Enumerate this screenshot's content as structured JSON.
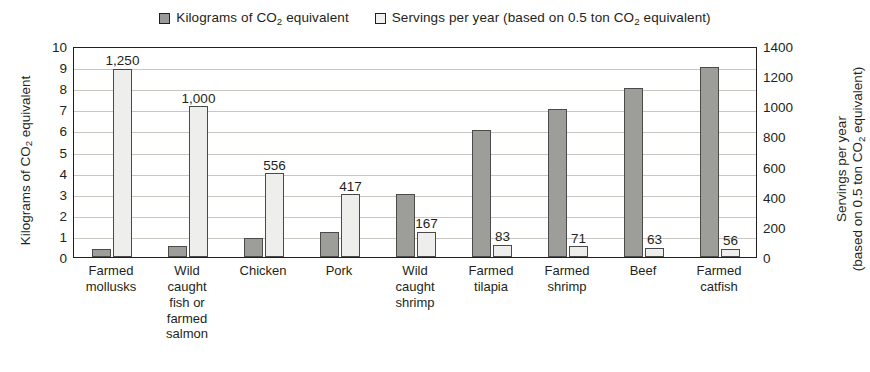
{
  "chart_data": {
    "type": "bar",
    "title": "",
    "categories": [
      "Farmed mollusks",
      "Wild caught fish or farmed salmon",
      "Chicken",
      "Pork",
      "Wild caught shrimp",
      "Farmed tilapia",
      "Farmed shrimp",
      "Beef",
      "Farmed catfish"
    ],
    "category_lines": [
      [
        "Farmed",
        "mollusks"
      ],
      [
        "Wild",
        "caught",
        "fish or",
        "farmed",
        "salmon"
      ],
      [
        "Chicken"
      ],
      [
        "Pork"
      ],
      [
        "Wild",
        "caught",
        "shrimp"
      ],
      [
        "Farmed",
        "tilapia"
      ],
      [
        "Farmed",
        "shrimp"
      ],
      [
        "Beef"
      ],
      [
        "Farmed",
        "catfish"
      ]
    ],
    "series": [
      {
        "name": "Kilograms of CO2 equivalent",
        "axis": "left",
        "color": "#9d9d9a",
        "values": [
          0.4,
          0.5,
          0.9,
          1.2,
          3.0,
          6.0,
          7.0,
          8.0,
          9.0
        ],
        "labels": [
          "",
          "",
          "",
          "",
          "",
          "",
          "",
          "",
          ""
        ]
      },
      {
        "name": "Servings per year (based on 0.5 ton CO2 equivalent)",
        "axis": "right",
        "color": "#eeeeec",
        "values": [
          1250,
          1000,
          556,
          417,
          167,
          83,
          71,
          63,
          56
        ],
        "labels": [
          "1,250",
          "1,000",
          "556",
          "417",
          "167",
          "83",
          "71",
          "63",
          "56"
        ]
      }
    ],
    "ylim_left": [
      0,
      10
    ],
    "ylim_right": [
      0,
      1400
    ],
    "yticks_left": [
      "10",
      "9",
      "8",
      "7",
      "6",
      "5",
      "4",
      "3",
      "2",
      "1",
      "0"
    ],
    "yticks_right": [
      "1400",
      "1200",
      "1000",
      "800",
      "600",
      "400",
      "200",
      "0"
    ],
    "ylabel_left_parts": {
      "pre": "Kilograms of CO",
      "sub": "2",
      "post": " equivalent"
    },
    "ylabel_right_line1_parts": {
      "pre": "Servings per year",
      "sub": "",
      "post": ""
    },
    "ylabel_right_line2_parts": {
      "pre": "(based on 0.5 ton CO",
      "sub": "2",
      "post": " equivalent)"
    },
    "grid": true,
    "legend_position": "top"
  },
  "legend": {
    "items": [
      {
        "swatch": "dark",
        "pre": "Kilograms of CO",
        "sub": "2",
        "post": " equivalent"
      },
      {
        "swatch": "light",
        "pre": "Servings per year (based on 0.5 ton CO",
        "sub": "2",
        "post": " equivalent)"
      }
    ]
  },
  "colors": {
    "dark_bar": "#9d9d9a",
    "light_bar": "#eeeeec",
    "axis": "#231f20",
    "grid": "#c9c7c2",
    "background": "#ffffff"
  }
}
